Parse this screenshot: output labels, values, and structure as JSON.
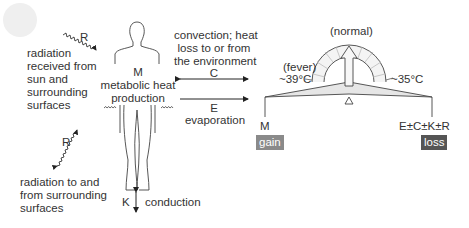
{
  "diagram": {
    "body": {
      "symbol": "M",
      "label_line1": "metabolic heat",
      "label_line2": "production"
    },
    "radiation_sun": {
      "symbol": "R",
      "label_lines": [
        "radiation",
        "received from",
        "sun and",
        "surrounding",
        "surfaces"
      ]
    },
    "radiation_surfaces": {
      "symbol": "R",
      "label_lines": [
        "radiation to and",
        "from surrounding",
        "surfaces"
      ]
    },
    "convection": {
      "symbol": "C",
      "label_lines": [
        "convection; heat",
        "loss to or from",
        "the environment"
      ]
    },
    "evaporation": {
      "symbol": "E",
      "label": "evaporation"
    },
    "conduction": {
      "symbol": "K",
      "label": "conduction"
    },
    "balance": {
      "normal_label": "(normal)",
      "fever_label": "(fever)",
      "fever_temp": "~39°C",
      "low_temp": "~35°C",
      "left_symbol": "M",
      "right_symbol": "E±C±K±R",
      "gain_label": "gain",
      "loss_label": "loss"
    },
    "colors": {
      "gain_bg": "#8a8a8a",
      "loss_bg": "#555555",
      "beam_fill": "#e6e6e6",
      "line": "#333333",
      "sun": "#efefef"
    }
  }
}
